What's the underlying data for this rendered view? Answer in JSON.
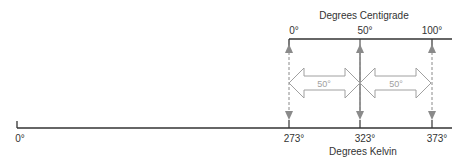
{
  "diagram": {
    "centigrade": {
      "title": "Degrees Centigrade",
      "ticks": [
        {
          "label": "0°",
          "x": 289
        },
        {
          "label": "50°",
          "x": 360
        },
        {
          "label": "100°",
          "x": 432
        }
      ]
    },
    "kelvin": {
      "title": "Degrees Kelvin",
      "ticks": [
        {
          "label": "0°",
          "x": 18
        },
        {
          "label": "273°",
          "x": 289
        },
        {
          "label": "323°",
          "x": 360
        },
        {
          "label": "373°",
          "x": 432
        }
      ]
    },
    "intervals": [
      {
        "label": "50°"
      },
      {
        "label": "50°"
      }
    ],
    "colors": {
      "axis": "#333333",
      "arrow": "#8a8a8a",
      "interval_arrow_stroke": "#a0a0a0",
      "interval_label": "#a0a0a0"
    }
  }
}
